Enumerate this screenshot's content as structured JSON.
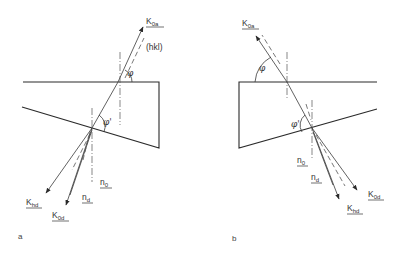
{
  "diagram": {
    "title": "",
    "colors": {
      "line": "#2a2a2a",
      "text": "#333333"
    },
    "panels": [
      {
        "id": "a",
        "label": "a",
        "labels": {
          "k0a": {
            "main": "K",
            "sub": "0a"
          },
          "hkl": "(hkl)",
          "phi": "φ",
          "phi_prime": "φ'",
          "khd": {
            "main": "K",
            "sub": "hd"
          },
          "k0d": {
            "main": "K",
            "sub": "0d"
          },
          "nd": {
            "main": "n",
            "sub": "d"
          },
          "n0": {
            "main": "n",
            "sub": "0"
          }
        }
      },
      {
        "id": "b",
        "label": "b",
        "labels": {
          "k0a": {
            "main": "K",
            "sub": "0a"
          },
          "phi": "φ",
          "phi_prime": "φ'",
          "n0": {
            "main": "n",
            "sub": "0"
          },
          "nd": {
            "main": "n",
            "sub": "d"
          },
          "k0d": {
            "main": "K",
            "sub": "0d"
          },
          "khd": {
            "main": "K",
            "sub": "hd"
          }
        }
      }
    ]
  }
}
